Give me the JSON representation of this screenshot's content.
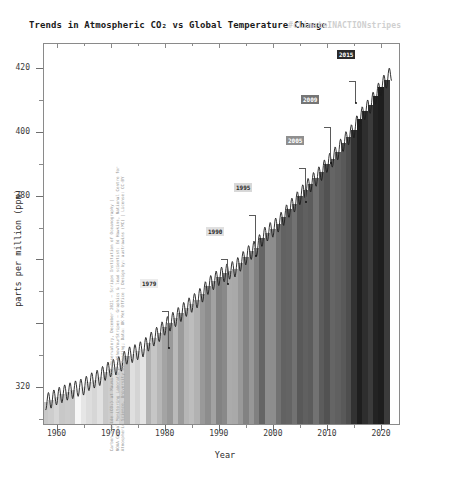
{
  "title": "Trends in Atmospheric CO₂ vs Global Temperature Change",
  "hashtag": "#climateINACTIONstripes",
  "axes": {
    "ylabel": "parts per million (ppm)",
    "xlabel": "Year",
    "yticks": [
      "320",
      "340",
      "360",
      "380",
      "400",
      "420"
    ],
    "ytick_values": [
      320,
      340,
      360,
      380,
      400,
      420
    ],
    "ytick_visible": [
      true,
      false,
      false,
      true,
      true,
      true
    ],
    "xticks": [
      "1960",
      "1970",
      "1980",
      "1990",
      "2000",
      "2010",
      "2020"
    ],
    "xtick_values": [
      1960,
      1970,
      1980,
      1990,
      2000,
      2010,
      2020
    ],
    "xlim": [
      1957.5,
      2023.5
    ],
    "ylim": [
      308,
      428
    ]
  },
  "credit": {
    "line1": "Carbon dioxide (CO₂) at Mauna Loa Observatory, December 2021 – Scripps Institution of Oceanography |",
    "line2": "NOAA Global Monitoring Laboratory | #ShowYourStripes – Graphics & lead scientist: Ed Hawkins, National Centre for",
    "line3": "Atmospheric Science, University of Reading; Data: UK Met Office | Design by: austrawins (MC) | License: CC-BY"
  },
  "annotations": [
    {
      "id": "paris-agreement",
      "label": "Paris Agreement\nadopted",
      "year": "2015",
      "year_bg": "#2a2a2a",
      "year_fg": "#ffffff",
      "text_right": 350,
      "text_top": 58,
      "year_left": 337,
      "year_top": 50,
      "bracket_x": 355,
      "bracket_top": 81,
      "bracket_h": 22,
      "dot_x": 356,
      "dot_y": 103
    },
    {
      "id": "copenhagen-accord",
      "label": "Copenhagen\nAccord",
      "year": "2009",
      "year_bg": "#757575",
      "year_fg": "#ffffff",
      "text_right": 325,
      "text_top": 104,
      "year_left": 301,
      "year_top": 95,
      "bracket_x": 330,
      "bracket_top": 127,
      "bracket_h": 36,
      "dot_x": 331,
      "dot_y": 163
    },
    {
      "id": "kyoto-protocol",
      "label": "Kyoto Protocol\nentered into force",
      "year": "2005",
      "year_bg": "#8f8f8f",
      "year_fg": "#ffffff",
      "text_right": 300,
      "text_top": 145,
      "year_left": 286,
      "year_top": 136,
      "bracket_x": 305,
      "bracket_top": 168,
      "bracket_h": 34,
      "dot_x": 306,
      "dot_y": 202
    },
    {
      "id": "first-un-climate-change-conference",
      "label": "First UN Climate\nChange Conference",
      "year": "1995",
      "year_bg": "#d8d8d8",
      "year_fg": "#2a2a2a",
      "text_right": 250,
      "text_top": 192,
      "year_left": 234,
      "year_top": 183,
      "bracket_x": 255,
      "bracket_top": 215,
      "bracket_h": 41,
      "dot_x": 256,
      "dot_y": 256
    },
    {
      "id": "first-ipcc-assessment-report",
      "label": "First IPCC\nAssessment Report",
      "year": "1990",
      "year_bg": "#e0e0e0",
      "year_fg": "#2a2a2a",
      "text_right": 222,
      "text_top": 236,
      "year_left": 206,
      "year_top": 227,
      "bracket_x": 227,
      "bracket_top": 259,
      "bracket_h": 25,
      "dot_x": 228,
      "dot_y": 284
    },
    {
      "id": "first-world-climate-conference",
      "label": "First World\nClimate Conference",
      "year": "1979",
      "year_bg": "#ececec",
      "year_fg": "#2a2a2a",
      "text_right": 163,
      "text_top": 288,
      "year_left": 140,
      "year_top": 279,
      "bracket_x": 168,
      "bracket_top": 311,
      "bracket_h": 37,
      "dot_x": 169,
      "dot_y": 348
    }
  ],
  "chart_data": {
    "type": "area",
    "title": "Trends in Atmospheric CO₂ vs Global Temperature Change",
    "xlabel": "Year",
    "ylabel": "parts per million (ppm)",
    "xlim": [
      1957.5,
      2023.5
    ],
    "ylim": [
      308,
      428
    ],
    "grid": false,
    "legend": "none",
    "series": [
      {
        "name": "Atmospheric CO2 (Mauna Loa, ppm annual mean)",
        "x": [
          1958,
          1959,
          1960,
          1961,
          1962,
          1963,
          1964,
          1965,
          1966,
          1967,
          1968,
          1969,
          1970,
          1971,
          1972,
          1973,
          1974,
          1975,
          1976,
          1977,
          1978,
          1979,
          1980,
          1981,
          1982,
          1983,
          1984,
          1985,
          1986,
          1987,
          1988,
          1989,
          1990,
          1991,
          1992,
          1993,
          1994,
          1995,
          1996,
          1997,
          1998,
          1999,
          2000,
          2001,
          2002,
          2003,
          2004,
          2005,
          2006,
          2007,
          2008,
          2009,
          2010,
          2011,
          2012,
          2013,
          2014,
          2015,
          2016,
          2017,
          2018,
          2019,
          2020,
          2021
        ],
        "values": [
          315.3,
          315.9,
          316.9,
          317.6,
          318.4,
          318.9,
          319.6,
          320.0,
          321.4,
          322.2,
          323.0,
          324.6,
          325.7,
          326.3,
          327.5,
          329.7,
          330.2,
          331.1,
          332.0,
          333.8,
          335.4,
          336.8,
          338.8,
          340.1,
          341.5,
          343.1,
          344.7,
          346.0,
          347.4,
          349.2,
          351.6,
          353.1,
          354.4,
          355.6,
          356.4,
          357.1,
          358.9,
          360.9,
          362.6,
          363.7,
          366.7,
          368.4,
          369.6,
          371.2,
          373.3,
          375.8,
          377.5,
          379.8,
          381.9,
          383.8,
          385.6,
          387.4,
          389.9,
          391.6,
          393.9,
          396.5,
          398.6,
          400.8,
          404.2,
          406.5,
          408.5,
          411.4,
          414.2,
          416.4
        ]
      },
      {
        "name": "Global temperature anomaly stripes (shade per year, light=cool, dark=warm)",
        "description": "Vertical grayscale stripes filling the area under the CO2 curve; darkness increases with warming",
        "x": [
          1958,
          1959,
          1960,
          1961,
          1962,
          1963,
          1964,
          1965,
          1966,
          1967,
          1968,
          1969,
          1970,
          1971,
          1972,
          1973,
          1974,
          1975,
          1976,
          1977,
          1978,
          1979,
          1980,
          1981,
          1982,
          1983,
          1984,
          1985,
          1986,
          1987,
          1988,
          1989,
          1990,
          1991,
          1992,
          1993,
          1994,
          1995,
          1996,
          1997,
          1998,
          1999,
          2000,
          2001,
          2002,
          2003,
          2004,
          2005,
          2006,
          2007,
          2008,
          2009,
          2010,
          2011,
          2012,
          2013,
          2014,
          2015,
          2016,
          2017,
          2018,
          2019,
          2020,
          2021
        ],
        "values": [
          0.06,
          0.03,
          -0.02,
          0.06,
          0.04,
          0.06,
          -0.2,
          -0.11,
          -0.06,
          -0.02,
          -0.08,
          0.05,
          0.03,
          -0.08,
          0.01,
          0.16,
          -0.07,
          -0.01,
          -0.1,
          0.18,
          0.07,
          0.16,
          0.26,
          0.32,
          0.14,
          0.31,
          0.16,
          0.12,
          0.18,
          0.32,
          0.39,
          0.27,
          0.45,
          0.41,
          0.22,
          0.23,
          0.32,
          0.45,
          0.33,
          0.46,
          0.61,
          0.38,
          0.39,
          0.54,
          0.63,
          0.62,
          0.54,
          0.68,
          0.64,
          0.66,
          0.54,
          0.66,
          0.72,
          0.61,
          0.64,
          0.68,
          0.74,
          0.9,
          1.01,
          0.92,
          0.85,
          0.98,
          1.01,
          0.85
        ]
      }
    ]
  }
}
